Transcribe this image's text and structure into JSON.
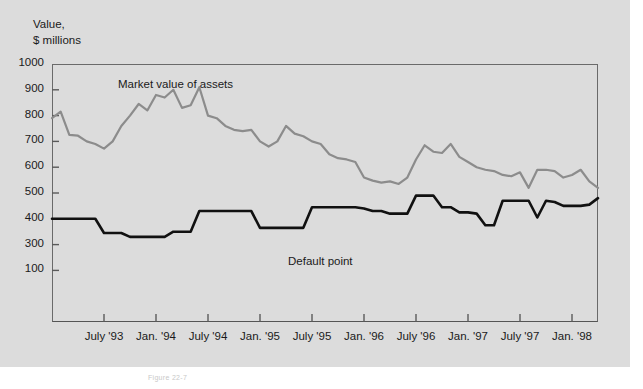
{
  "figure": {
    "background_color": "#dcdcdc",
    "caption": "Figure 22-7",
    "axis_title_line1": "Value,",
    "axis_title_line2": "$ millions"
  },
  "chart_data": {
    "type": "line",
    "title": "",
    "subtitle": "",
    "xlabel": "",
    "ylabel": "Value, $ millions",
    "grid": false,
    "legend_position": "inline-annotations",
    "ylim": [
      0,
      1000
    ],
    "yticks": [
      1000,
      900,
      800,
      700,
      600,
      500,
      400,
      300,
      100
    ],
    "ytick_labels": [
      "1000",
      "900",
      "800",
      "700",
      "600",
      "500",
      "400",
      "300",
      "100"
    ],
    "ytick_note": "Tick between 300 and the axis base is labeled 100 in the original print (printed where 200 would fall).",
    "xticks": [
      "July '93",
      "Jan. '94",
      "July '94",
      "Jan. '95",
      "July '95",
      "Jan. '96",
      "July '96",
      "Jan. '97",
      "July '97",
      "Jan. '98"
    ],
    "x_start": "Jan. '93",
    "x_end": "Jan. '98",
    "x_step_months": 1,
    "annotations": [
      {
        "text": "Market value of assets",
        "series": "market_value"
      },
      {
        "text": "Default point",
        "series": "default_point"
      }
    ],
    "series": [
      {
        "name": "Market value of assets",
        "color": "#8c8c8c",
        "values": [
          790,
          815,
          725,
          722,
          700,
          690,
          672,
          700,
          760,
          800,
          845,
          820,
          880,
          870,
          900,
          830,
          840,
          910,
          800,
          790,
          760,
          745,
          740,
          745,
          700,
          680,
          700,
          760,
          730,
          720,
          700,
          690,
          650,
          635,
          630,
          620,
          560,
          548,
          540,
          545,
          535,
          560,
          630,
          685,
          660,
          655,
          690,
          640,
          620,
          600,
          590,
          585,
          570,
          565,
          580,
          520,
          590,
          590,
          585,
          560,
          570,
          590,
          545,
          520
        ]
      },
      {
        "name": "Default point",
        "color": "#111111",
        "values": [
          400,
          400,
          400,
          400,
          400,
          400,
          345,
          345,
          345,
          330,
          330,
          330,
          330,
          330,
          350,
          350,
          350,
          430,
          430,
          430,
          430,
          430,
          430,
          430,
          365,
          365,
          365,
          365,
          365,
          365,
          445,
          445,
          445,
          445,
          445,
          445,
          440,
          430,
          430,
          420,
          420,
          420,
          490,
          490,
          490,
          445,
          445,
          425,
          425,
          420,
          375,
          375,
          470,
          470,
          470,
          470,
          405,
          470,
          465,
          450,
          450,
          450,
          455,
          480
        ]
      }
    ]
  }
}
